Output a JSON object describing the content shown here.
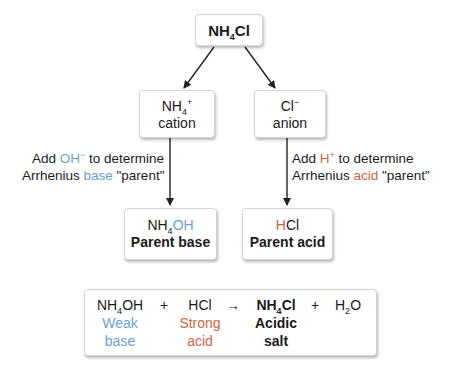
{
  "top": {
    "formula_base": "NH",
    "formula_sub": "4",
    "formula_end": "Cl"
  },
  "cation": {
    "formula_base": "NH",
    "formula_sub": "4",
    "formula_sup": "+",
    "label": "cation"
  },
  "anion": {
    "formula_base": "Cl",
    "formula_sup": "−",
    "label": "anion"
  },
  "left_note": {
    "line1_pre": "Add ",
    "line1_ion": "OH",
    "line1_sup": "−",
    "line1_post": " to determine",
    "line2_pre": "Arrhenius ",
    "line2_word": "base",
    "line2_post": " \"parent\""
  },
  "right_note": {
    "line1_pre": "Add ",
    "line1_ion": "H",
    "line1_sup": "+",
    "line1_post": " to determine",
    "line2_pre": "Arrhenius ",
    "line2_word": "acid",
    "line2_post": " \"parent\""
  },
  "parent_base": {
    "formula_base": "NH",
    "formula_sub": "4",
    "formula_oh": "OH",
    "label": "Parent base"
  },
  "parent_acid": {
    "formula_h": "H",
    "formula_cl": "Cl",
    "label": "Parent acid"
  },
  "equation": {
    "base": {
      "base": "NH",
      "sub": "4",
      "end": "OH",
      "desc1": "Weak",
      "desc2": "base"
    },
    "plus1": "+",
    "acid": {
      "formula": "HCl",
      "desc1": "Strong",
      "desc2": "acid"
    },
    "arrow": "→",
    "salt": {
      "base": "NH",
      "sub": "4",
      "end": "Cl",
      "desc1": "Acidic",
      "desc2": "salt"
    },
    "plus2": "+",
    "water": {
      "base": "H",
      "sub": "2",
      "end": "O"
    }
  },
  "colors": {
    "base": "#6a9fd4",
    "acid": "#d1643f"
  }
}
